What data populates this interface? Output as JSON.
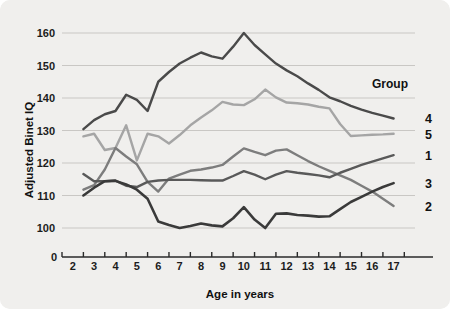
{
  "figure": {
    "background_color": "#f0efed",
    "plot_background_color": "#f3f2f0"
  },
  "chart_data": {
    "type": "line",
    "title": "",
    "xlabel": "Age in years",
    "ylabel": "Adjusted Binet IQ",
    "x": [
      2,
      3,
      4,
      5,
      6,
      7,
      8,
      9,
      10,
      11,
      12,
      13,
      14,
      15,
      16,
      17
    ],
    "xlim": [
      1.5,
      18
    ],
    "ylim": [
      98,
      163
    ],
    "x_ticks": [
      "2",
      "3",
      "4",
      "5",
      "6",
      "7",
      "8",
      "9",
      "10",
      "11",
      "12",
      "13",
      "14",
      "15",
      "16",
      "17"
    ],
    "x_axis_origin_label": "0",
    "y_ticks": [
      "100",
      "110",
      "120",
      "130",
      "140",
      "150",
      "160"
    ],
    "y_tick_values": [
      100,
      110,
      120,
      130,
      140,
      150,
      160
    ],
    "y_axis_origin_label": "0",
    "grid": true,
    "grid_axis": "y",
    "legend_title": "Group",
    "legend_position": "right-endpoints",
    "series": [
      {
        "name": "4",
        "label": "4",
        "color": "#4a4a4a",
        "width": 2.4,
        "x": [
          2.5,
          3,
          3.5,
          4,
          4.5,
          5,
          5.5,
          6,
          6.5,
          7,
          7.5,
          8,
          8.5,
          9,
          9.5,
          10,
          10.5,
          11,
          11.5,
          12,
          12.5,
          13,
          13.5,
          14,
          14.5,
          15,
          15.5,
          16,
          16.5,
          17
        ],
        "values": [
          130.4,
          133.2,
          135.0,
          136.0,
          141.0,
          139.4,
          136.0,
          145.0,
          148.0,
          150.6,
          152.4,
          154.0,
          152.8,
          152.1,
          155.8,
          160.0,
          156.3,
          153.4,
          150.6,
          148.5,
          146.7,
          144.5,
          142.5,
          140.2,
          139.0,
          137.6,
          136.4,
          135.4,
          134.6,
          133.7
        ]
      },
      {
        "name": "5",
        "label": "5",
        "color": "#a5a5a5",
        "width": 2.4,
        "x": [
          2.5,
          3,
          3.5,
          4,
          4.5,
          5,
          5.5,
          6,
          6.5,
          7,
          7.5,
          8,
          8.5,
          9,
          9.5,
          10,
          10.5,
          11,
          11.5,
          12,
          12.5,
          13,
          13.5,
          14,
          14.5,
          15,
          15.5,
          16,
          16.5,
          17
        ],
        "values": [
          128.2,
          129.0,
          124.0,
          124.6,
          131.6,
          120.8,
          129.0,
          128.2,
          126.0,
          128.6,
          131.6,
          134.0,
          136.2,
          138.8,
          138.0,
          137.8,
          139.6,
          142.6,
          140.2,
          138.6,
          138.4,
          138.0,
          137.3,
          136.8,
          132.0,
          128.3,
          128.5,
          128.7,
          128.8,
          129.0
        ]
      },
      {
        "name": "1",
        "label": "1",
        "color": "#7d7d7d",
        "width": 2.4,
        "x": [
          2.5,
          3,
          3.5,
          4,
          4.5,
          5,
          5.5,
          6,
          6.5,
          7,
          7.5,
          8,
          8.5,
          9,
          9.5,
          10,
          10.5,
          11,
          11.5,
          12,
          12.5,
          13,
          13.5,
          14,
          14.5,
          15,
          15.5,
          16,
          16.5,
          17
        ],
        "values": [
          111.8,
          113.2,
          118.0,
          124.6,
          122.0,
          119.6,
          114.2,
          111.2,
          115.2,
          116.4,
          117.6,
          118.0,
          118.6,
          119.4,
          122.0,
          124.5,
          123.4,
          122.4,
          123.8,
          124.2,
          122.4,
          120.6,
          119.0,
          117.6,
          116.2,
          114.8,
          113.0,
          111.2,
          109.0,
          106.8
        ]
      },
      {
        "name": "3",
        "label": "3",
        "color": "#595959",
        "width": 2.4,
        "x": [
          2.5,
          3,
          3.5,
          4,
          4.5,
          5,
          5.5,
          6,
          6.5,
          7,
          7.5,
          8,
          8.5,
          9,
          9.5,
          10,
          10.5,
          11,
          11.5,
          12,
          12.5,
          13,
          13.5,
          14,
          14.5,
          15,
          15.5,
          16,
          16.5,
          17
        ],
        "values": [
          116.6,
          114.4,
          114.4,
          114.6,
          113.0,
          112.6,
          114.2,
          114.6,
          114.8,
          114.8,
          114.8,
          114.7,
          114.6,
          114.6,
          116.0,
          117.5,
          116.4,
          115.0,
          116.4,
          117.5,
          117.0,
          116.6,
          116.2,
          115.6,
          117.0,
          118.2,
          119.4,
          120.4,
          121.4,
          122.4
        ]
      },
      {
        "name": "2",
        "label": "2",
        "color": "#3a3a3a",
        "width": 2.6,
        "x": [
          2.5,
          3,
          3.5,
          4,
          4.5,
          5,
          5.5,
          6,
          6.5,
          7,
          7.5,
          8,
          8.5,
          9,
          9.5,
          10,
          10.5,
          11,
          11.5,
          12,
          12.5,
          13,
          13.5,
          14,
          14.5,
          15,
          15.5,
          16,
          16.5,
          17
        ],
        "values": [
          110.0,
          112.4,
          114.4,
          114.5,
          113.4,
          111.8,
          109.0,
          102.0,
          100.9,
          100.0,
          100.6,
          101.4,
          100.8,
          100.5,
          103.0,
          106.4,
          102.6,
          100.0,
          104.4,
          104.5,
          104.0,
          103.8,
          103.5,
          103.6,
          105.8,
          108.0,
          109.6,
          111.2,
          112.6,
          113.8
        ]
      }
    ],
    "legend_entries": [
      {
        "label": "4",
        "y_value": 133.7,
        "color": "#4a4a4a"
      },
      {
        "label": "5",
        "y_value": 129.0,
        "color": "#a5a5a5"
      },
      {
        "label": "1",
        "y_value": 122.4,
        "color": "#7d7d7d"
      },
      {
        "label": "3",
        "y_value": 113.8,
        "color": "#595959"
      },
      {
        "label": "2",
        "y_value": 106.8,
        "color": "#a5a5a5"
      }
    ]
  }
}
